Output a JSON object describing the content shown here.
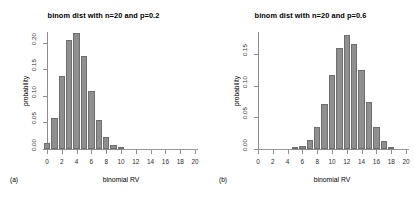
{
  "figure": {
    "panels": [
      {
        "caption": "(a)",
        "title": "binom dist with n=20 and p=0.2",
        "xlabel": "binomial RV",
        "ylabel": "probability"
      },
      {
        "caption": "(b)",
        "title": "binom dist with n=20 and p=0.6",
        "xlabel": "binomial RV",
        "ylabel": "probability"
      }
    ],
    "colors": {
      "bar_fill": "#8f8f8f",
      "bar_border": "#6e6e6e",
      "axis": "#8d8d8d",
      "text": "#000000",
      "background": "#ffffff"
    }
  },
  "chart_data": [
    {
      "type": "bar",
      "title": "binom dist with n=20 and p=0.2",
      "xlabel": "binomial RV",
      "ylabel": "probability",
      "panel": "(a)",
      "n": 20,
      "p": 0.2,
      "categories": [
        0,
        1,
        2,
        3,
        4,
        5,
        6,
        7,
        8,
        9,
        10,
        11,
        12,
        13,
        14,
        15,
        16,
        17,
        18,
        19,
        20
      ],
      "values": [
        0.0115,
        0.0576,
        0.1369,
        0.2054,
        0.2182,
        0.1746,
        0.1091,
        0.0545,
        0.0222,
        0.0074,
        0.002,
        0.0005,
        0.0001,
        0.0,
        0.0,
        0.0,
        0.0,
        0.0,
        0.0,
        0.0,
        0.0
      ],
      "xlim": [
        0,
        20
      ],
      "ylim": [
        0,
        0.22
      ],
      "ytick_labels": [
        "0.00",
        "0.05",
        "0.10",
        "0.15",
        "0.20"
      ],
      "ytick_values": [
        0.0,
        0.05,
        0.1,
        0.15,
        0.2
      ],
      "xtick_labels": [
        "0",
        "2",
        "4",
        "6",
        "8",
        "10",
        "12",
        "14",
        "16",
        "18",
        "20"
      ],
      "xtick_values": [
        0,
        2,
        4,
        6,
        8,
        10,
        12,
        14,
        16,
        18,
        20
      ],
      "grid": false,
      "legend": "none"
    },
    {
      "type": "bar",
      "title": "binom dist with n=20 and p=0.6",
      "xlabel": "binomial RV",
      "ylabel": "probability",
      "panel": "(b)",
      "n": 20,
      "p": 0.6,
      "categories": [
        0,
        1,
        2,
        3,
        4,
        5,
        6,
        7,
        8,
        9,
        10,
        11,
        12,
        13,
        14,
        15,
        16,
        17,
        18,
        19,
        20
      ],
      "values": [
        0.0,
        0.0,
        0.0,
        0.0,
        0.0003,
        0.0013,
        0.0049,
        0.0146,
        0.0355,
        0.071,
        0.1171,
        0.1597,
        0.1797,
        0.1659,
        0.1244,
        0.0746,
        0.035,
        0.0123,
        0.0031,
        0.0005,
        0.0
      ],
      "xlim": [
        0,
        20
      ],
      "ylim": [
        0,
        0.185
      ],
      "ytick_labels": [
        "0.00",
        "0.05",
        "0.10",
        "0.15"
      ],
      "ytick_values": [
        0.0,
        0.05,
        0.1,
        0.15
      ],
      "xtick_labels": [
        "0",
        "2",
        "4",
        "6",
        "8",
        "10",
        "12",
        "14",
        "16",
        "18",
        "20"
      ],
      "xtick_values": [
        0,
        2,
        4,
        6,
        8,
        10,
        12,
        14,
        16,
        18,
        20
      ],
      "grid": false,
      "legend": "none"
    }
  ]
}
